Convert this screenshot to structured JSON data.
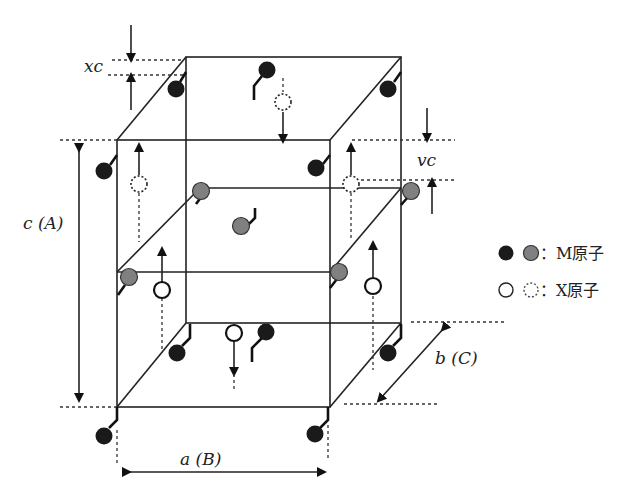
{
  "figure": {
    "labels": {
      "xc": "xc",
      "vc": "vc",
      "c_axis": "c (A)",
      "a_axis": "a (B)",
      "b_axis": "b (C)"
    },
    "legend": [
      {
        "symbols": [
          "black-filled-circle",
          "gray-filled-circle"
        ],
        "text": "：M原子"
      },
      {
        "symbols": [
          "open-circle",
          "dotted-circle"
        ],
        "text": "：X原子"
      }
    ],
    "colors": {
      "m_atom_dark": "#1a1a1a",
      "m_atom_gray": "#808080",
      "line": "#222222"
    }
  }
}
